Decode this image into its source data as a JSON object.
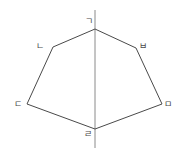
{
  "diagram": {
    "title": "",
    "axis": {
      "x": 95,
      "y1": 10,
      "y2": 148,
      "color": "#8a8a8a"
    },
    "edge_color": "#4a4a4a",
    "vertices": [
      {
        "id": "g",
        "label": "ㄱ",
        "x": 95,
        "y": 29,
        "label_x": 85,
        "label_y": 17
      },
      {
        "id": "b",
        "label": "ㅂ",
        "x": 136,
        "y": 48,
        "label_x": 139,
        "label_y": 42
      },
      {
        "id": "m",
        "label": "ㅁ",
        "x": 162,
        "y": 104,
        "label_x": 164,
        "label_y": 100
      },
      {
        "id": "r",
        "label": "ㄹ",
        "x": 95,
        "y": 129,
        "label_x": 84,
        "label_y": 130
      },
      {
        "id": "d",
        "label": "ㄷ",
        "x": 27,
        "y": 104,
        "label_x": 14,
        "label_y": 100
      },
      {
        "id": "n",
        "label": "ㄴ",
        "x": 53,
        "y": 47,
        "label_x": 36,
        "label_y": 42
      }
    ],
    "labels": {
      "g": "ㄱ",
      "n": "ㄴ",
      "d": "ㄷ",
      "r": "ㄹ",
      "m": "ㅁ",
      "b": "ㅂ"
    }
  }
}
